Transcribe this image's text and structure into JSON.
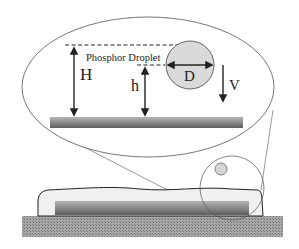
{
  "figure": {
    "labels": {
      "droplet": "Phosphor Droplet",
      "height_total": "H",
      "height_droplet": "h",
      "diameter": "D",
      "velocity": "V"
    },
    "colors": {
      "line": "#333333",
      "droplet_fill": "#d9d9d9",
      "bar_dark": "#6a6a6a",
      "bar_light": "#b8b8b8",
      "substrate": "#9a9a9a",
      "encapsulant": "#f0f0f0"
    }
  }
}
